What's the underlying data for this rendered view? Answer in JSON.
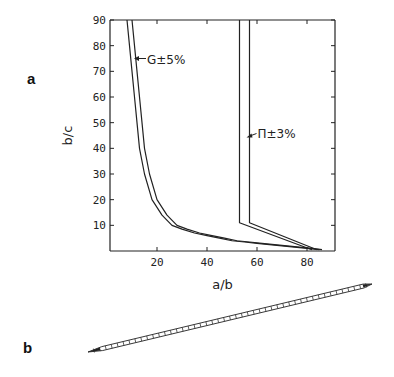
{
  "panel_labels": {
    "a": "a",
    "b": "b"
  },
  "chart_data": {
    "type": "line",
    "title": "",
    "xlabel": "a/b",
    "ylabel": "b/c",
    "xlim": [
      0,
      90
    ],
    "ylim": [
      0,
      90
    ],
    "x_ticks": [
      20,
      40,
      60,
      80
    ],
    "y_ticks": [
      10,
      20,
      30,
      40,
      50,
      60,
      70,
      80,
      90
    ],
    "grid": false,
    "series": [
      {
        "name": "G lower bound",
        "group": "G",
        "x": [
          8,
          9,
          10,
          11,
          12,
          13,
          15,
          18,
          22,
          26,
          30,
          35,
          40,
          45,
          50,
          55,
          60,
          65,
          70,
          75,
          80,
          85
        ],
        "y": [
          90,
          80,
          70,
          60,
          50,
          40,
          30,
          20,
          14,
          10,
          8.5,
          7,
          6,
          5,
          4,
          3.5,
          3,
          2.5,
          2,
          1.5,
          1,
          0.5
        ]
      },
      {
        "name": "G upper bound",
        "group": "G",
        "x": [
          10,
          11,
          12,
          13,
          14,
          15,
          17,
          20,
          24,
          28,
          32,
          37,
          42,
          47,
          52,
          57,
          62,
          67,
          72,
          77,
          82,
          86
        ],
        "y": [
          90,
          80,
          70,
          60,
          50,
          40,
          30,
          20,
          14,
          10,
          8.5,
          7,
          6,
          5,
          4,
          3.5,
          3,
          2.5,
          2,
          1.5,
          1,
          0.5
        ]
      },
      {
        "name": "Π lower bound",
        "group": "Π",
        "x": [
          53,
          53,
          82
        ],
        "y": [
          90,
          11,
          0.5
        ]
      },
      {
        "name": "Π upper bound",
        "group": "Π",
        "x": [
          57,
          57,
          84
        ],
        "y": [
          90,
          11,
          0.5
        ]
      }
    ],
    "annotations": [
      {
        "text": "G±5%",
        "label_main": "G",
        "pm": "±",
        "value": "5%",
        "points_to": {
          "x": 10,
          "y": 75
        }
      },
      {
        "text": "Π±3%",
        "label_main": "Π",
        "pm": "±",
        "value": "3%",
        "points_to": {
          "x": 57,
          "y": 45
        }
      }
    ]
  },
  "figure_b": {
    "description": "elongated needle-shaped particle drawn diagonally"
  }
}
